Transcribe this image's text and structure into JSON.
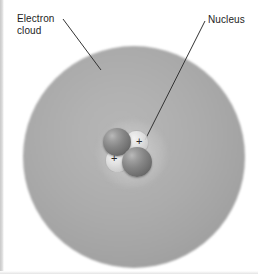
{
  "figure": {
    "background_color": "#ffffff"
  },
  "labels": {
    "electron_cloud": "Electron\ncloud",
    "nucleus": "Nucleus"
  },
  "colors": {
    "cloud_fill": "#a8a8a8",
    "cloud_edge": "#d8d8d8",
    "neutron": "#7a7a7a",
    "proton": "#e2e2e2",
    "text": "#1d1d1d",
    "leader_line": "#333333"
  },
  "diagram": {
    "type": "atom-model",
    "electron_cloud": {
      "center_x": 134,
      "center_y": 157,
      "radius": 111
    },
    "nucleus": {
      "particles": [
        {
          "kind": "neutron",
          "charge": "",
          "position": "upper-left"
        },
        {
          "kind": "proton",
          "charge": "+",
          "position": "upper-right"
        },
        {
          "kind": "proton",
          "charge": "+",
          "position": "lower-left"
        },
        {
          "kind": "neutron",
          "charge": "",
          "position": "lower-right"
        }
      ],
      "proton_charge_symbol": "+",
      "proton_count": 2,
      "neutron_count": 2
    },
    "leader_lines": [
      {
        "label": "electron_cloud",
        "from_x": 63,
        "from_y": 19,
        "to_x": 101,
        "to_y": 70
      },
      {
        "label": "nucleus",
        "from_x": 205,
        "from_y": 21,
        "to_x": 145,
        "to_y": 140
      }
    ]
  }
}
